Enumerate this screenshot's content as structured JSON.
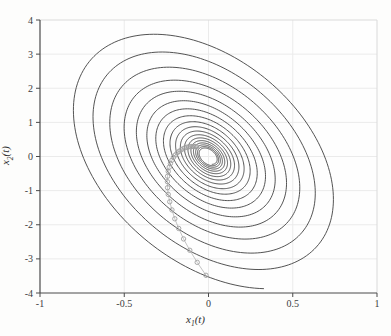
{
  "figure": {
    "background": "#fdfdfc",
    "plot_background": "#fefefe",
    "axis_color": "#4a4a4a",
    "box_color": "#dadada",
    "grid_color": "#ebebeb",
    "tick_label_color": "#3c3c3c",
    "xlabel": {
      "var": "x",
      "sub": "1",
      "rest": "(t)"
    },
    "ylabel": {
      "var": "x",
      "sub": "2",
      "rest": "(t)"
    }
  },
  "chart_data": {
    "type": "line",
    "title": "",
    "xlabel": "x1(t)",
    "ylabel": "x2(t)",
    "xlim": [
      -1,
      1
    ],
    "ylim": [
      -4,
      4
    ],
    "xticks": [
      -1,
      -0.5,
      0,
      0.5,
      1
    ],
    "xtick_labels": [
      "-1",
      "-0.5",
      "0",
      "0.5",
      "1"
    ],
    "yticks": [
      -4,
      -3,
      -2,
      -1,
      0,
      1,
      2,
      3,
      4
    ],
    "ytick_labels": [
      "-4",
      "-3",
      "-2",
      "-1",
      "0",
      "1",
      "2",
      "3",
      "4"
    ],
    "grid": true,
    "legend": "none",
    "series": [
      {
        "name": "continuous-trajectory-spiral",
        "style": "solid",
        "color": "#3f3f3f",
        "line_width": 0.9,
        "generator": {
          "kind": "elliptical-outward-spiral",
          "x_amplitude_start": 0.05,
          "x_amplitude_end": 0.842,
          "turns": 18,
          "y_to_x_ratio": 4.6,
          "phase_deg": 113,
          "theta_end_deg": 67,
          "direction": "clockwise-outward"
        }
      },
      {
        "name": "sampled-trajectory-markers",
        "style": "line+circle-markers",
        "marker": "o",
        "marker_color": "#9f9f9f",
        "line_color": "#bcbcbc",
        "marker_radius": 2.2,
        "points": [
          [
            -0.071,
            0.286
          ],
          [
            -0.079,
            0.292
          ],
          [
            -0.088,
            0.295
          ],
          [
            -0.098,
            0.294
          ],
          [
            -0.108,
            0.29
          ],
          [
            -0.119,
            0.282
          ],
          [
            -0.129,
            0.269
          ],
          [
            -0.141,
            0.25
          ],
          [
            -0.152,
            0.225
          ],
          [
            -0.163,
            0.193
          ],
          [
            -0.175,
            0.152
          ],
          [
            -0.186,
            0.103
          ],
          [
            -0.197,
            0.044
          ],
          [
            -0.208,
            -0.026
          ],
          [
            -0.217,
            -0.109
          ],
          [
            -0.226,
            -0.204
          ],
          [
            -0.233,
            -0.313
          ],
          [
            -0.239,
            -0.437
          ],
          [
            -0.243,
            -0.579
          ],
          [
            -0.244,
            -0.737
          ],
          [
            -0.243,
            -0.914
          ],
          [
            -0.239,
            -1.11
          ],
          [
            -0.23,
            -1.327
          ],
          [
            -0.217,
            -1.565
          ],
          [
            -0.2,
            -1.825
          ],
          [
            -0.177,
            -2.108
          ],
          [
            -0.148,
            -2.415
          ],
          [
            -0.111,
            -2.748
          ],
          [
            -0.067,
            -3.102
          ],
          [
            -0.015,
            -3.481
          ]
        ]
      }
    ]
  }
}
